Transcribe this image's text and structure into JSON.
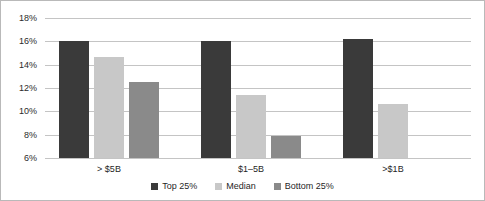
{
  "chart_data": {
    "type": "bar",
    "title": "",
    "subtitle": "",
    "xlabel": "",
    "ylabel": "",
    "categories": [
      "> $5B",
      "$1–5B",
      ">$1B"
    ],
    "series": [
      {
        "name": "Top 25%",
        "color": "#3a3a3a",
        "values": [
          16.0,
          16.0,
          16.2
        ]
      },
      {
        "name": "Median",
        "color": "#c8c8c8",
        "values": [
          14.7,
          11.4,
          10.6
        ]
      },
      {
        "name": "Bottom 25%",
        "color": "#8a8a8a",
        "values": [
          12.5,
          7.85,
          null
        ]
      }
    ],
    "ylim": [
      6,
      18
    ],
    "ytick_values": [
      6,
      8,
      10,
      12,
      14,
      16,
      18
    ],
    "ytick_labels": [
      "6%",
      "8%",
      "10%",
      "12%",
      "14%",
      "16%",
      "18%"
    ],
    "value_suffix": "%",
    "grid": "horizontal",
    "legend_position": "bottom",
    "border_color": "#b9b9b9",
    "gridline_color": "#c4c4c4",
    "background": "#ffffff"
  }
}
